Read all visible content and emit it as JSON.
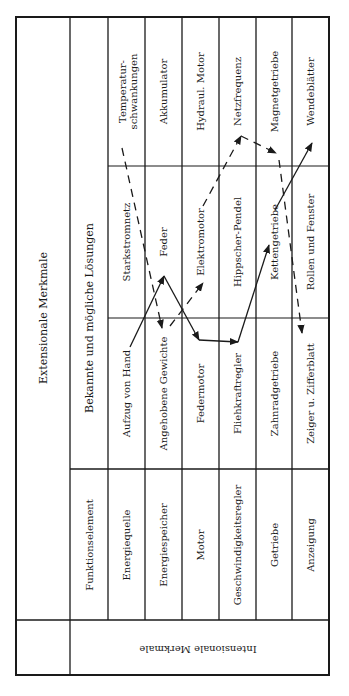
{
  "table": {
    "extensional_header": "Extensionale Merkmale",
    "solutions_header": "Bekannte und mögliche Lösungen",
    "function_header": "Funktionselement",
    "intensional_header": "Intensionale Merkmale",
    "rows": [
      {
        "function": "Energiequelle",
        "solutions": [
          "Aufzug von Hand",
          "Starkstromnetz",
          "Temperatur-|schwankungen"
        ]
      },
      {
        "function": "Energiespeicher",
        "solutions": [
          "Angehobene Gewichte",
          "Feder",
          "Akkumulator"
        ]
      },
      {
        "function": "Motor",
        "solutions": [
          "Federmotor",
          "Elektromotor",
          "Hydraul. Motor"
        ]
      },
      {
        "function": "Geschwindigkeitsregler",
        "solutions": [
          "Fliehkraftregler",
          "Hippscher-Pendel",
          "Netzfrequenz"
        ]
      },
      {
        "function": "Getriebe",
        "solutions": [
          "Zahnradgetriebe",
          "Kettengetriebe",
          "Magnetgetriebe"
        ]
      },
      {
        "function": "Anzeigung",
        "solutions": [
          "Zeiger u. Zifferblatt",
          "Rollen und Fenster",
          "Wendeblätter"
        ]
      }
    ]
  },
  "paths": {
    "solid": {
      "style": "solid",
      "sequence": [
        "Aufzug von Hand",
        "Feder",
        "Federmotor",
        "Fliehkraftregler",
        "Kettengetriebe",
        "Wendeblätter"
      ]
    },
    "dashed": {
      "style": "dashed",
      "sequence": [
        "Temperatur-schwankungen",
        "Angehobene Gewichte",
        "Elektromotor",
        "Netzfrequenz",
        "Magnetgetriebe",
        "Zeiger u. Zifferblatt"
      ]
    }
  },
  "colors": {
    "ink": "#1a1a1a",
    "paper": "#ffffff"
  }
}
